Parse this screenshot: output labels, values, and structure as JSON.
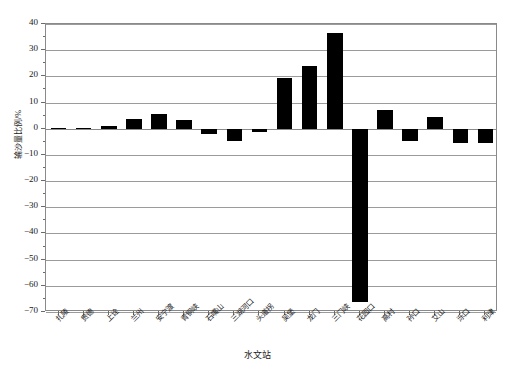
{
  "chart_data": {
    "type": "bar",
    "title": "",
    "xlabel": "水文站",
    "ylabel": "输沙量比例/%",
    "ylim": [
      -70,
      40
    ],
    "ytick_step": 10,
    "grid": true,
    "legend": "none",
    "bar_color": "#000000",
    "categories": [
      "扎陵",
      "贵德",
      "上诠",
      "兰州",
      "安宁渡",
      "青铜峡",
      "石嘴山",
      "三湖河口",
      "头道拐",
      "吴堡",
      "龙门",
      "三门峡",
      "花园口",
      "高村",
      "孙口",
      "艾山",
      "泺口",
      "利津"
    ],
    "values": [
      0.3,
      0.4,
      0.9,
      3.6,
      5.8,
      3.2,
      -2.0,
      -4.8,
      -1.2,
      19.2,
      24.0,
      36.5,
      -66.0,
      7.0,
      -4.8,
      4.4,
      -5.5,
      -5.5
    ],
    "ytick_labels": [
      "40",
      "30",
      "20",
      "10",
      "0",
      "−10",
      "−20",
      "−30",
      "−40",
      "−50",
      "−60",
      "−70"
    ],
    "ytick_values": [
      40,
      30,
      20,
      10,
      0,
      -10,
      -20,
      -30,
      -40,
      -50,
      -60,
      -70
    ]
  }
}
